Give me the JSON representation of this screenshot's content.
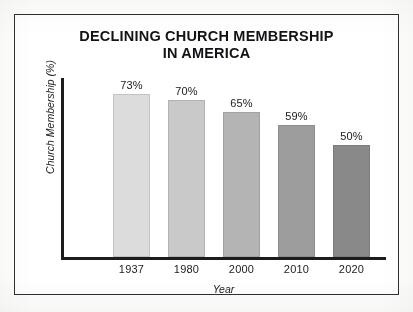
{
  "chart_data": {
    "type": "bar",
    "title": "DECLINING CHURCH MEMBERSHIP IN AMERICA",
    "title_line1": "DECLINING CHURCH MEMBERSHIP",
    "title_line2": "IN AMERICA",
    "xlabel": "Year",
    "ylabel": "Church Membership (%)",
    "categories": [
      "1937",
      "1980",
      "2000",
      "2010",
      "2020"
    ],
    "values": [
      73,
      70,
      65,
      59,
      50
    ],
    "value_labels": [
      "73%",
      "70%",
      "65%",
      "59%",
      "50%"
    ],
    "ylim": [
      0,
      80
    ],
    "grid": false,
    "legend": false,
    "bar_colors": [
      "#dcdcdc",
      "#c9c9c9",
      "#b4b4b4",
      "#9d9d9d",
      "#898989"
    ],
    "bar_border_colors": [
      "#c2c2c2",
      "#b2b2b2",
      "#a2a2a2",
      "#8e8e8e",
      "#7c7c7c"
    ],
    "axis_color": "#1b1c1e",
    "frame_color": "#2d2f31",
    "text_color": "#121316",
    "background": "#ffffff"
  }
}
